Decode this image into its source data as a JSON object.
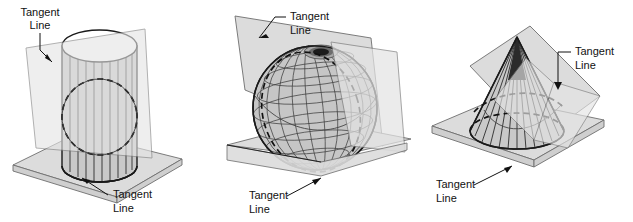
{
  "figure": {
    "background_color": "#ffffff",
    "line_color": "#111111",
    "plane_fill": "#dcdcdc",
    "solid_fill": "#c9c9c9",
    "panels": [
      {
        "id": "cylinder",
        "shape_name": "cylinder",
        "labels": [
          {
            "line1": "Tangent",
            "line2": "Line",
            "position": "top-left"
          },
          {
            "line1": "Tangent",
            "line2": "Line",
            "position": "bottom-right"
          }
        ]
      },
      {
        "id": "sphere",
        "shape_name": "sphere",
        "labels": [
          {
            "line1": "Tangent",
            "line2": "Line",
            "position": "top-right"
          },
          {
            "line1": "Tangent",
            "line2": "Line",
            "position": "bottom-left"
          }
        ]
      },
      {
        "id": "cone",
        "shape_name": "cone",
        "labels": [
          {
            "line1": "Tangent",
            "line2": "Line",
            "position": "top-right"
          },
          {
            "line1": "Tangent",
            "line2": "Line",
            "position": "bottom-left"
          }
        ]
      }
    ]
  }
}
